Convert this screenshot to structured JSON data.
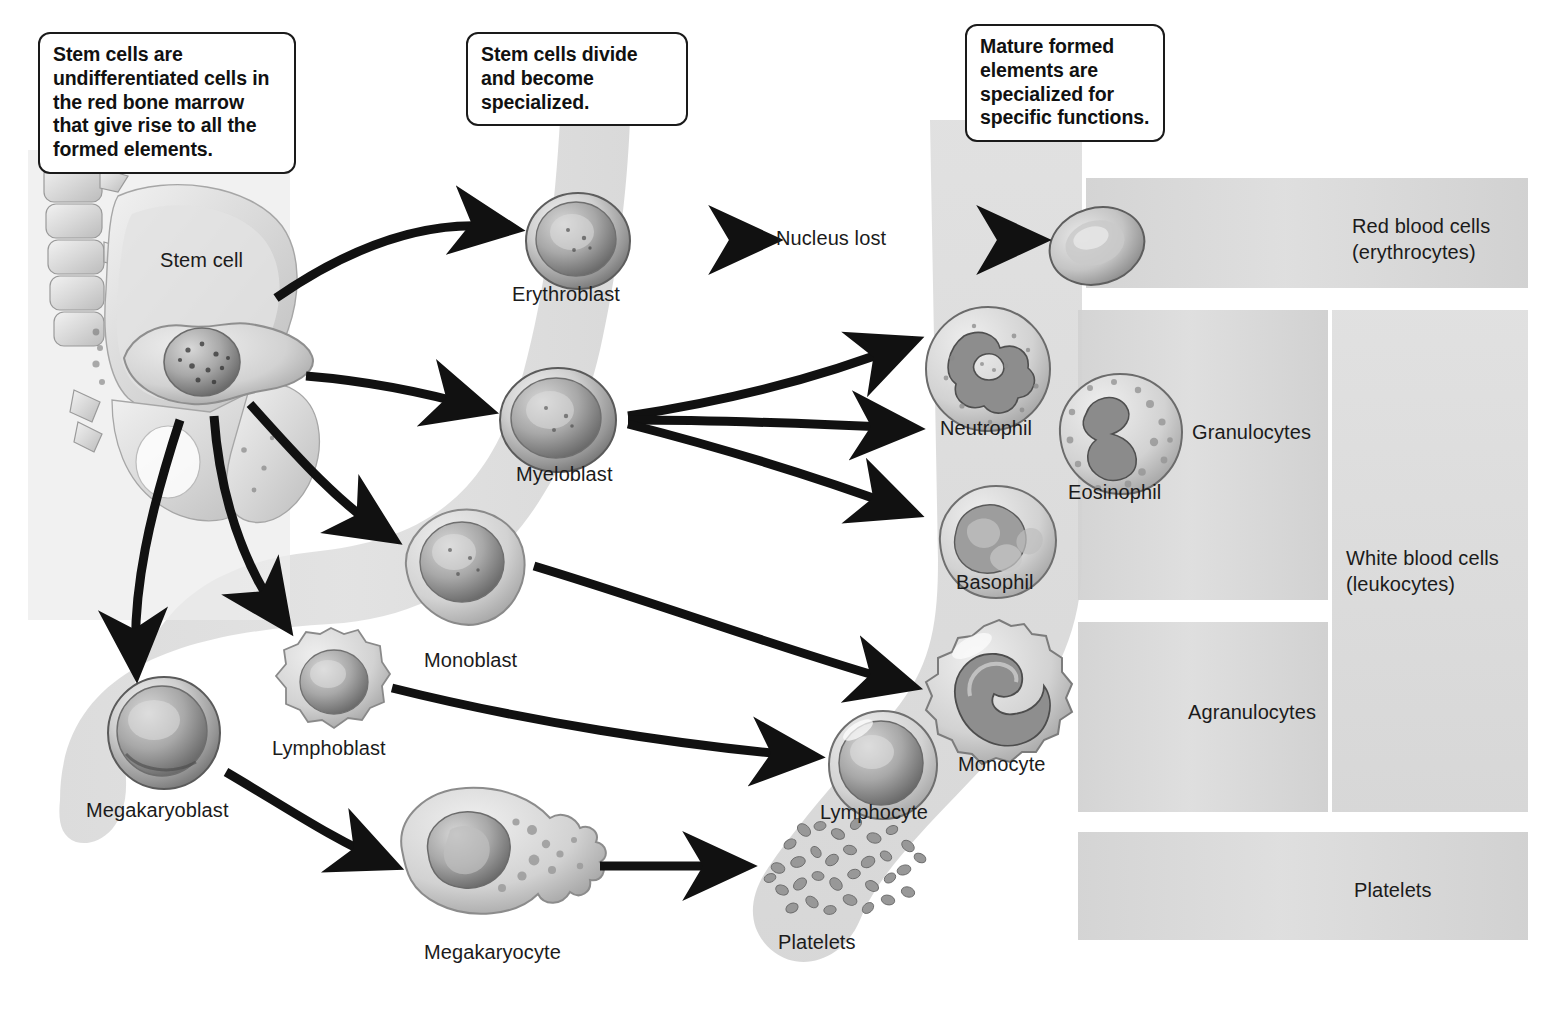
{
  "diagram": {
    "background_color": "#ffffff",
    "band_color": "#dcdcdc",
    "band_color_light": "#e4e4e4",
    "text_color": "#1b1b1b",
    "arrow_color": "#111111"
  },
  "callouts": [
    {
      "id": "callout-stem-cells",
      "text": "Stem cells are undifferentiated cells in the red bone marrow that give rise to all the formed elements."
    },
    {
      "id": "callout-divide",
      "text": "Stem cells divide and become specialized."
    },
    {
      "id": "callout-mature",
      "text": "Mature formed elements are specialized for specific functions."
    }
  ],
  "cell_labels": {
    "stem_cell": "Stem cell",
    "erythroblast": "Erythroblast",
    "myeloblast": "Myeloblast",
    "monoblast": "Monoblast",
    "lymphoblast": "Lymphoblast",
    "megakaryoblast": "Megakaryoblast",
    "megakaryocyte": "Megakaryocyte",
    "neutrophil": "Neutrophil",
    "eosinophil": "Eosinophil",
    "basophil": "Basophil",
    "monocyte": "Monocyte",
    "lymphocyte": "Lymphocyte",
    "platelets": "Platelets"
  },
  "annotations": {
    "nucleus_lost": "Nucleus lost"
  },
  "categories": {
    "red_blood_cells": "Red blood cells\n(erythrocytes)",
    "red_blood_cells_line1": "Red blood cells",
    "red_blood_cells_line2": "(erythrocytes)",
    "granulocytes": "Granulocytes",
    "agranulocytes": "Agranulocytes",
    "white_blood_cells_line1": "White blood cells",
    "white_blood_cells_line2": "(leukocytes)",
    "platelets": "Platelets"
  },
  "lineage": {
    "type": "flow",
    "stages": [
      "Stem cell",
      "Blast (committed precursor)",
      "Mature formed element"
    ],
    "paths": [
      {
        "from": "Stem cell",
        "to": "Erythroblast"
      },
      {
        "from": "Erythroblast",
        "to": "Red blood cell",
        "note": "Nucleus lost"
      },
      {
        "from": "Stem cell",
        "to": "Myeloblast"
      },
      {
        "from": "Myeloblast",
        "to": "Neutrophil"
      },
      {
        "from": "Myeloblast",
        "to": "Eosinophil"
      },
      {
        "from": "Myeloblast",
        "to": "Basophil"
      },
      {
        "from": "Stem cell",
        "to": "Monoblast"
      },
      {
        "from": "Monoblast",
        "to": "Monocyte"
      },
      {
        "from": "Stem cell",
        "to": "Lymphoblast"
      },
      {
        "from": "Lymphoblast",
        "to": "Lymphocyte"
      },
      {
        "from": "Stem cell",
        "to": "Megakaryoblast"
      },
      {
        "from": "Megakaryoblast",
        "to": "Megakaryocyte"
      },
      {
        "from": "Megakaryocyte",
        "to": "Platelets"
      }
    ],
    "groupings": [
      {
        "group": "Red blood cells (erythrocytes)",
        "members": [
          "Red blood cell"
        ]
      },
      {
        "group": "Granulocytes",
        "members": [
          "Neutrophil",
          "Eosinophil",
          "Basophil"
        ]
      },
      {
        "group": "Agranulocytes",
        "members": [
          "Monocyte",
          "Lymphocyte"
        ]
      },
      {
        "group": "White blood cells (leukocytes)",
        "members": [
          "Granulocytes",
          "Agranulocytes"
        ]
      },
      {
        "group": "Platelets",
        "members": [
          "Platelets"
        ]
      }
    ]
  }
}
